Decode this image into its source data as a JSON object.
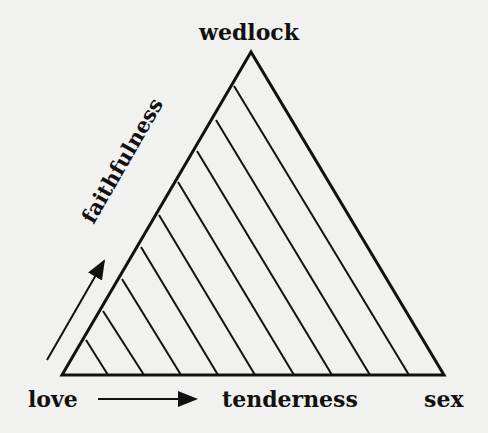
{
  "labels": {
    "top": "wedlock",
    "left_edge": "faithfulness",
    "bottom_left": "love",
    "bottom_middle": "tenderness",
    "bottom_right": "sex"
  },
  "colors": {
    "background": "#f1f1ef",
    "ink": "#111111"
  },
  "triangle": {
    "apex": [
      251,
      52
    ],
    "left": [
      62,
      375
    ],
    "right": [
      444,
      375
    ]
  },
  "hatch_count": 9
}
